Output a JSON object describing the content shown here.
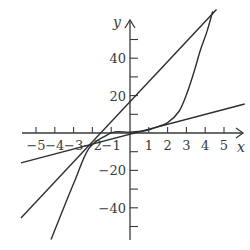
{
  "chart_data": {
    "type": "line",
    "title": "",
    "xlabel": "x",
    "ylabel": "y",
    "xlim": [
      -5.5,
      6
    ],
    "ylim": [
      -57,
      60
    ],
    "grid": false,
    "legend": null,
    "x_ticks": [
      -5,
      -4,
      -3,
      -2,
      -1,
      1,
      2,
      3,
      4,
      5
    ],
    "x_tick_labels": [
      "−5",
      "−4",
      "−3",
      "−2",
      "−1",
      "1",
      "2",
      "3",
      "4",
      "5"
    ],
    "y_ticks": [
      -50,
      -40,
      -30,
      -20,
      -10,
      10,
      20,
      30,
      40,
      50
    ],
    "y_tick_labels": [
      {
        "value": 40,
        "label": "40"
      },
      {
        "value": 20,
        "label": "20"
      },
      {
        "value": -20,
        "label": "−20"
      },
      {
        "value": -40,
        "label": "−40"
      }
    ],
    "series": [
      {
        "name": "cubic curve",
        "kind": "curve",
        "points": [
          [
            -4.2,
            -57
          ],
          [
            -3,
            -27
          ],
          [
            -2.2,
            -8.5
          ],
          [
            -1.3,
            -1.5
          ],
          [
            -0.8,
            0.6
          ],
          [
            0,
            0.5
          ],
          [
            0.8,
            1.2
          ],
          [
            1.3,
            2.8
          ],
          [
            2,
            5.5
          ],
          [
            2.6,
            11.5
          ],
          [
            3,
            20.5
          ],
          [
            3.4,
            32.5
          ],
          [
            3.75,
            44.5
          ],
          [
            4.1,
            54.5
          ],
          [
            4.4,
            65
          ]
        ]
      },
      {
        "name": "steep line",
        "kind": "line",
        "points": [
          [
            -5.8,
            -45.5
          ],
          [
            4.6,
            66
          ]
        ]
      },
      {
        "name": "shallow line",
        "kind": "line",
        "points": [
          [
            -5.8,
            -16
          ],
          [
            6.1,
            15.5
          ]
        ]
      }
    ],
    "intersections": [
      [
        -2.2,
        -8.5
      ],
      [
        4.1,
        54.5
      ]
    ]
  },
  "labels": {
    "x_axis": "x",
    "y_axis": "y"
  }
}
